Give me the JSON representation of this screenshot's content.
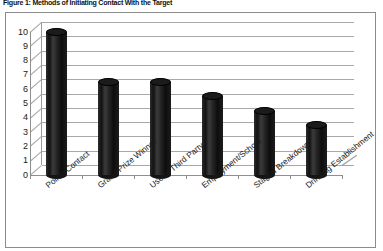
{
  "figure": {
    "caption": "Figure 1: Methods of Initiating Contact With the Target"
  },
  "chart_data": {
    "type": "bar",
    "title": "Figure 1: Methods of Initiating Contact With the Target",
    "xlabel": "",
    "ylabel": "",
    "ylim": [
      0,
      10
    ],
    "ytick_step": 1,
    "grid": true,
    "legend": "none",
    "style": "3d-cylinder",
    "bar_color": "#1b1b1b",
    "gridline_color": "#a8a8a8",
    "axis_color": "#8f8f8f",
    "frame_color": "#8c8c8c",
    "background": "#ffffff",
    "categories": [
      "Police Contact",
      "Grand Prize Winner",
      "Use of Third Party",
      "Employment/School",
      "Staged Breakdown",
      "Drinking Establishment"
    ],
    "values": [
      10,
      6.5,
      6.5,
      5.5,
      4.5,
      3.5
    ],
    "yticks": [
      "0",
      "1",
      "2",
      "3",
      "4",
      "5",
      "6",
      "7",
      "8",
      "9",
      "10"
    ]
  }
}
